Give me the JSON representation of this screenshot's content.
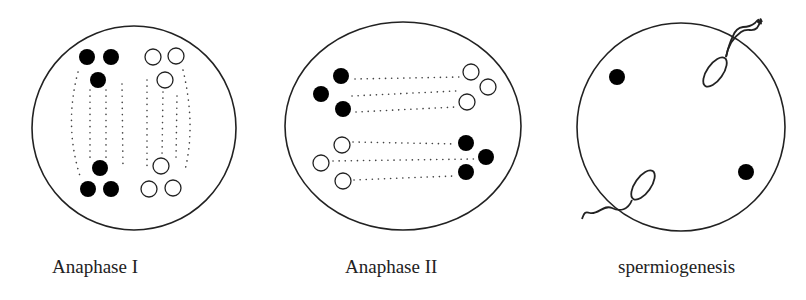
{
  "figure": {
    "panels": [
      {
        "id": "anaphase-1",
        "label": "Anaphase I"
      },
      {
        "id": "anaphase-2",
        "label": "Anaphase II"
      },
      {
        "id": "spermiogenesis",
        "label": "spermiogenesis"
      }
    ],
    "colors": {
      "stroke": "#222222",
      "filled": "#000000",
      "background": "#ffffff"
    }
  }
}
